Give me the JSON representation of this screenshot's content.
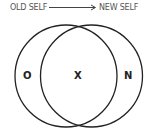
{
  "header": {
    "from_label": "OLD SELF",
    "to_label": "NEW SELF"
  },
  "venn": {
    "left_circle_label": "O",
    "intersection_label": "X",
    "right_circle_label": "N"
  },
  "colors": {
    "stroke": "#222222",
    "text": "#555555",
    "background": "#ffffff"
  }
}
